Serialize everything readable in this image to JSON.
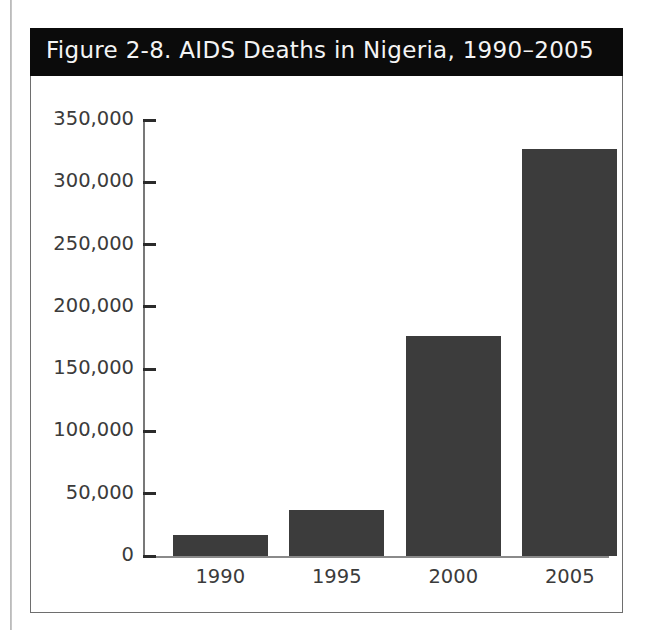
{
  "figure": {
    "title": "Figure 2-8. AIDS Deaths in Nigeria, 1990–2005",
    "title_band_color": "#0b0b0b",
    "title_text_color": "#f4f4f4",
    "frame_color": "#6e6e6e",
    "background_color": "#ffffff"
  },
  "axes": {
    "y_ticks": [
      {
        "label": "350,000",
        "value": 350000
      },
      {
        "label": "300,000",
        "value": 300000
      },
      {
        "label": "250,000",
        "value": 250000
      },
      {
        "label": "200,000",
        "value": 200000
      },
      {
        "label": "150,000",
        "value": 150000
      },
      {
        "label": "100,000",
        "value": 100000
      },
      {
        "label": "50,000",
        "value": 50000
      },
      {
        "label": "0",
        "value": 0
      }
    ],
    "x_ticks": [
      {
        "label": "1990"
      },
      {
        "label": "1995"
      },
      {
        "label": "2000"
      },
      {
        "label": "2005"
      }
    ],
    "axis_line_color": "#787878",
    "tick_color": "#2b2b2b",
    "label_color": "#3b3b3b"
  },
  "chart_data": {
    "type": "bar",
    "title": "Figure 2-8. AIDS Deaths in Nigeria, 1990–2005",
    "xlabel": "",
    "ylabel": "",
    "categories": [
      "1990",
      "1995",
      "2000",
      "2005"
    ],
    "values": [
      17000,
      37000,
      177000,
      327000
    ],
    "value_labels": [
      "17,000",
      "37,000",
      "177,000",
      "327,000"
    ],
    "ylim": [
      0,
      350000
    ],
    "ytick_step": 50000,
    "ytick_labels": [
      "0",
      "50,000",
      "100,000",
      "150,000",
      "200,000",
      "250,000",
      "300,000",
      "350,000"
    ],
    "grid": false,
    "legend": false,
    "bar_color": "#3c3c3c"
  }
}
